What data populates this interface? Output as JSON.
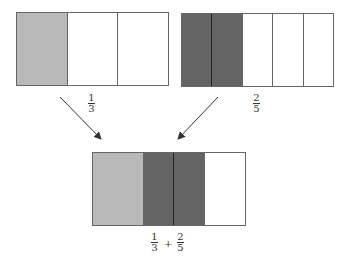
{
  "colors": {
    "light_shade": "#b9b9b9",
    "dark_shade": "#646464",
    "empty": "#ffffff",
    "border": "#666666"
  },
  "diagram": {
    "top_left": {
      "fraction": {
        "numerator": "1",
        "denominator": "3"
      },
      "cells": [
        "light",
        "empty",
        "empty"
      ]
    },
    "top_right": {
      "fraction": {
        "numerator": "2",
        "denominator": "5"
      },
      "cells": [
        "dark",
        "dark",
        "empty",
        "empty",
        "empty"
      ]
    },
    "bottom": {
      "expression": {
        "left": {
          "numerator": "1",
          "denominator": "3"
        },
        "operator": "+",
        "right": {
          "numerator": "2",
          "denominator": "5"
        }
      },
      "cells": [
        "light",
        "dark",
        "dark",
        "empty"
      ]
    }
  }
}
